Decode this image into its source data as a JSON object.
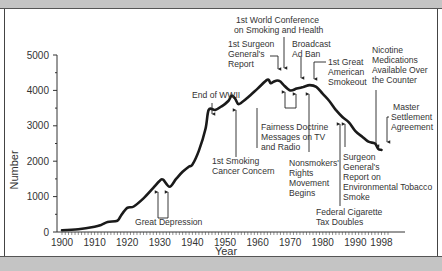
{
  "chart_data": {
    "type": "line",
    "title": "",
    "xlabel": "Year",
    "ylabel": "Number",
    "xlim": [
      1900,
      2000
    ],
    "ylim": [
      0,
      5000
    ],
    "grid": false,
    "legend": null,
    "x_ticks": [
      "1900",
      "1910",
      "1920",
      "1930",
      "1940",
      "1950",
      "1960",
      "1970",
      "1980",
      "1990",
      "1998"
    ],
    "y_ticks": [
      "0",
      "1000",
      "2000",
      "3000",
      "4000",
      "5000"
    ],
    "series": [
      {
        "name": "Cigarettes per capita",
        "x": [
          1900,
          1905,
          1910,
          1912,
          1914,
          1917,
          1918,
          1920,
          1922,
          1925,
          1928,
          1930,
          1931,
          1933,
          1935,
          1937,
          1939,
          1940,
          1942,
          1944,
          1945,
          1947,
          1949,
          1951,
          1952,
          1953,
          1954,
          1955,
          1957,
          1960,
          1963,
          1964,
          1965,
          1966,
          1967,
          1968,
          1970,
          1972,
          1974,
          1976,
          1978,
          1980,
          1982,
          1984,
          1986,
          1988,
          1990,
          1992,
          1994,
          1996,
          1997,
          1998
        ],
        "values": [
          50,
          80,
          150,
          200,
          280,
          320,
          450,
          680,
          720,
          950,
          1250,
          1450,
          1480,
          1280,
          1500,
          1700,
          1850,
          1900,
          2300,
          2900,
          3450,
          3450,
          3550,
          3700,
          3850,
          3780,
          3620,
          3650,
          3800,
          4050,
          4300,
          4200,
          4250,
          4280,
          4250,
          4150,
          4000,
          4050,
          4100,
          4150,
          4100,
          3900,
          3700,
          3450,
          3250,
          3100,
          2850,
          2700,
          2550,
          2500,
          2350,
          2320
        ]
      }
    ],
    "annotations": [
      {
        "text": "Great Depression",
        "years": [
          1930,
          1933
        ]
      },
      {
        "text": "End of WWII",
        "years": [
          1945
        ]
      },
      {
        "text": "1st Smoking Cancer Concern",
        "years": [
          1953
        ]
      },
      {
        "text": "1st Surgeon General's Report",
        "years": [
          1964
        ]
      },
      {
        "text": "1st World Conference on Smoking and Health",
        "years": [
          1967
        ]
      },
      {
        "text": "Fairness Doctrine Messages on TV and Radio",
        "years": [
          1967,
          1970
        ]
      },
      {
        "text": "Broadcast Ad Ban",
        "years": [
          1971
        ]
      },
      {
        "text": "Nonsmokers' Rights Movement Begins",
        "years": [
          1972
        ]
      },
      {
        "text": "1st Great American Smokeout",
        "years": [
          1976
        ]
      },
      {
        "text": "Federal Cigarette Tax Doubles",
        "years": [
          1983
        ]
      },
      {
        "text": "Surgeon General's Report on Environmental Tobacco Smoke",
        "years": [
          1986
        ]
      },
      {
        "text": "Nicotine Medications Available Over the Counter",
        "years": [
          1996
        ]
      },
      {
        "text": "Master Settlement Agreement",
        "years": [
          1998
        ]
      }
    ]
  },
  "axes": {
    "x_title": "Year",
    "y_title": "Number",
    "x_ticks": [
      "1900",
      "1910",
      "1920",
      "1930",
      "1940",
      "1950",
      "1960",
      "1970",
      "1980",
      "1990",
      "1998"
    ],
    "y_ticks": [
      "0",
      "1000",
      "2000",
      "3000",
      "4000",
      "5000"
    ]
  },
  "labels": {
    "great_depression": "Great Depression",
    "end_wwii": "End of WWII",
    "smoking_cancer_1": "1st Smoking",
    "smoking_cancer_2": "Cancer Concern",
    "surgeon_1": "1st Surgeon",
    "surgeon_2": "General's",
    "surgeon_3": "Report",
    "world_conf_1": "1st World Conference",
    "world_conf_2": "on Smoking and Health",
    "fairness_1": "Fairness Doctrine",
    "fairness_2": "Messages on TV",
    "fairness_3": "and Radio",
    "broadcast_1": "Broadcast",
    "broadcast_2": "Ad Ban",
    "nonsmokers_1": "Nonsmokers'",
    "nonsmokers_2": "Rights",
    "nonsmokers_3": "Movement",
    "nonsmokers_4": "Begins",
    "smokeout_1": "1st Great",
    "smokeout_2": "American",
    "smokeout_3": "Smokeout",
    "tax_1": "Federal Cigarette",
    "tax_2": "Tax Doubles",
    "ets_1": "Surgeon",
    "ets_2": "General's",
    "ets_3": "Report on",
    "ets_4": "Environmental Tobacco",
    "ets_5": "Smoke",
    "nicotine_1": "Nicotine",
    "nicotine_2": "Medications",
    "nicotine_3": "Available Over",
    "nicotine_4": "the Counter",
    "msa_1": "Master",
    "msa_2": "Settlement",
    "msa_3": "Agreement"
  },
  "colors": {
    "line": "#1a1a1a",
    "text": "#333333",
    "frame_bar": "#c4c4c4"
  }
}
